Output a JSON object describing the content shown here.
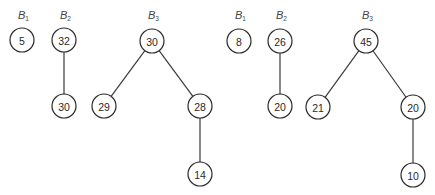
{
  "diagram": {
    "type": "binomial-heaps",
    "node_radius": 12,
    "colors": {
      "stroke": "#2a2a2a",
      "background": "#ffffff",
      "text": "#2a2a2a"
    },
    "heaps": [
      {
        "name": "heap-left",
        "trees": [
          {
            "label": "B",
            "subscript": "1",
            "label_pos": [
              22,
              15
            ],
            "nodes": [
              {
                "id": "L1a",
                "value": "5",
                "x": 22,
                "y": 40
              }
            ],
            "edges": []
          },
          {
            "label": "B",
            "subscript": "2",
            "label_pos": [
              64,
              15
            ],
            "nodes": [
              {
                "id": "L2a",
                "value": "32",
                "x": 64,
                "y": 40
              },
              {
                "id": "L2b",
                "value": "30",
                "x": 64,
                "y": 106
              }
            ],
            "edges": [
              [
                "L2a",
                "L2b"
              ]
            ]
          },
          {
            "label": "B",
            "subscript": "3",
            "label_pos": [
              152,
              15
            ],
            "nodes": [
              {
                "id": "L3a",
                "value": "30",
                "x": 152,
                "y": 41
              },
              {
                "id": "L3b",
                "value": "29",
                "x": 104,
                "y": 106
              },
              {
                "id": "L3c",
                "value": "28",
                "x": 200,
                "y": 106
              },
              {
                "id": "L3d",
                "value": "14",
                "x": 200,
                "y": 174
              }
            ],
            "edges": [
              [
                "L3a",
                "L3b"
              ],
              [
                "L3a",
                "L3c"
              ],
              [
                "L3c",
                "L3d"
              ]
            ]
          }
        ]
      },
      {
        "name": "heap-right",
        "trees": [
          {
            "label": "B",
            "subscript": "1",
            "label_pos": [
              239,
              15
            ],
            "nodes": [
              {
                "id": "R1a",
                "value": "8",
                "x": 239,
                "y": 41
              }
            ],
            "edges": []
          },
          {
            "label": "B",
            "subscript": "2",
            "label_pos": [
              280,
              15
            ],
            "nodes": [
              {
                "id": "R2a",
                "value": "26",
                "x": 280,
                "y": 41
              },
              {
                "id": "R2b",
                "value": "20",
                "x": 280,
                "y": 106
              }
            ],
            "edges": [
              [
                "R2a",
                "R2b"
              ]
            ]
          },
          {
            "label": "B",
            "subscript": "3",
            "label_pos": [
              366,
              15
            ],
            "nodes": [
              {
                "id": "R3a",
                "value": "45",
                "x": 366,
                "y": 41
              },
              {
                "id": "R3b",
                "value": "21",
                "x": 318,
                "y": 107
              },
              {
                "id": "R3c",
                "value": "20",
                "x": 413,
                "y": 107
              },
              {
                "id": "R3d",
                "value": "10",
                "x": 413,
                "y": 175
              }
            ],
            "edges": [
              [
                "R3a",
                "R3b"
              ],
              [
                "R3a",
                "R3c"
              ],
              [
                "R3c",
                "R3d"
              ]
            ]
          }
        ]
      }
    ]
  }
}
